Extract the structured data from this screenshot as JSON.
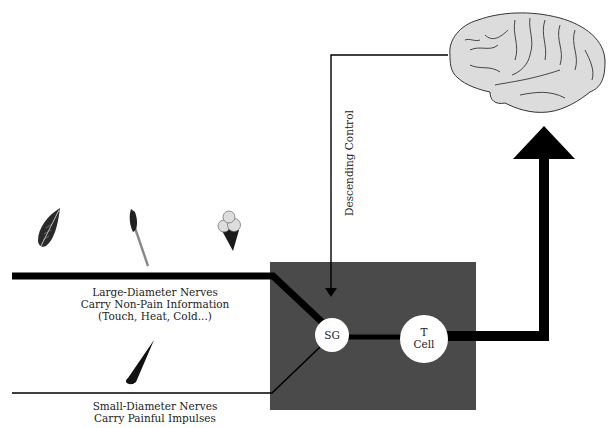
{
  "diagram": {
    "colors": {
      "gate_box": "#4a4a4a",
      "nerve": "#000000",
      "circle_fill": "#ffffff",
      "brain_fill": "#dcdcdc",
      "background": "#ffffff"
    },
    "labels": {
      "large_nerves_line1": "Large-Diameter Nerves",
      "large_nerves_line2": "Carry Non-Pain Information",
      "large_nerves_line3": "(Touch, Heat, Cold...)",
      "small_nerves_line1": "Small-Diameter Nerves",
      "small_nerves_line2": "Carry Painful Impulses",
      "descending_control": "Descending Control",
      "sg": "SG",
      "t_cell_line1": "T",
      "t_cell_line2": "Cell"
    },
    "icons": [
      "leaf-icon",
      "match-icon",
      "ice-cream-icon",
      "tack-icon",
      "brain-icon"
    ],
    "nodes": [
      {
        "id": "SG",
        "label": "SG"
      },
      {
        "id": "T Cell",
        "label": "T Cell"
      },
      {
        "id": "Brain",
        "label": ""
      }
    ],
    "edges": [
      {
        "from": "Large-Diameter Nerves",
        "to": "SG",
        "style": "thick"
      },
      {
        "from": "Small-Diameter Nerves",
        "to": "SG",
        "style": "thin"
      },
      {
        "from": "SG",
        "to": "T Cell",
        "style": "medium"
      },
      {
        "from": "T Cell",
        "to": "Brain",
        "style": "thick-arrow"
      },
      {
        "from": "Brain",
        "to": "SG",
        "style": "thin-arrow",
        "label": "Descending Control"
      }
    ]
  }
}
